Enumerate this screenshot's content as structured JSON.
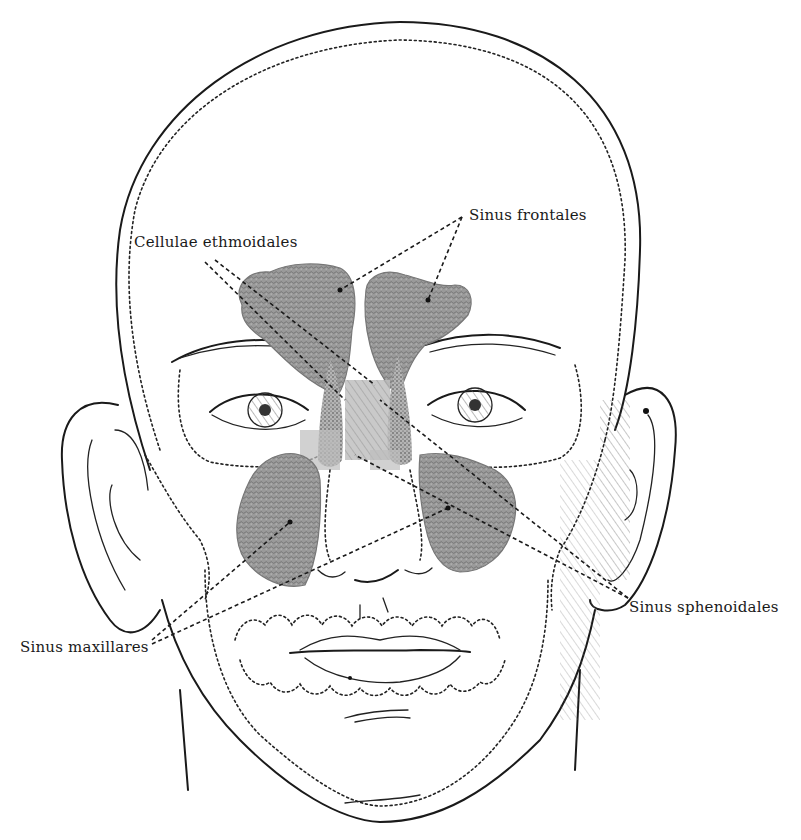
{
  "figure": {
    "type": "anatomical illustration",
    "colors": {
      "background": "#ffffff",
      "ink": "#1a1a1a",
      "sinus_fill": "#8a8a8a"
    }
  },
  "labels": {
    "cellulae_ethmoidales": "Cellulae ethmoidales",
    "sinus_frontales": "Sinus frontales",
    "sinus_sphenoidales": "Sinus sphenoidales",
    "sinus_maxillares": "Sinus maxillares"
  }
}
